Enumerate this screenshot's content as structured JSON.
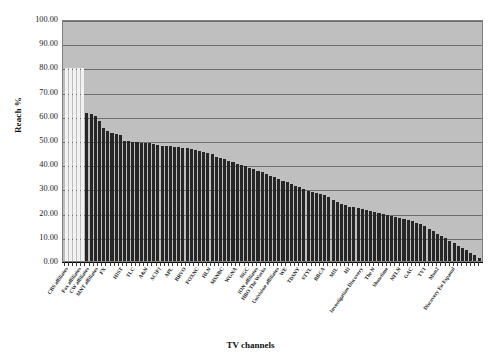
{
  "chart_data": {
    "type": "bar",
    "title": "",
    "xlabel": "TV channels",
    "ylabel": "Reach %",
    "ylim": [
      0,
      100
    ],
    "ytick_labels": [
      "100.00",
      "90.00",
      "80.00",
      "70.00",
      "60.00",
      "50.00",
      "40.00",
      "30.00",
      "20.00",
      "10.00",
      "0.00"
    ],
    "ytick_values": [
      100,
      90,
      80,
      70,
      60,
      50,
      40,
      30,
      20,
      10,
      0
    ],
    "grid": true,
    "legend": "none",
    "plot_background": "#bfbfbf",
    "bar_color": "#262626",
    "highlight_bar_color": "#f2f2f2",
    "categories": [
      "CBS affiliates",
      "ABC affiliates",
      "NBC affiliates",
      "Fox affiliates",
      "PBS affiliates",
      "CW affiliates",
      "ION affiliates b",
      "MNT affiliates",
      "ESPN",
      "FX",
      "USA",
      "TNT",
      "TBS",
      "HIST",
      "DISC",
      "LIFE",
      "TLC",
      "AMC",
      "SPIKE",
      "A&N",
      "FAM",
      "SYFY",
      "SCIFI",
      "TRAV",
      "E!",
      "APL",
      "HGTV",
      "FOOD",
      "BRVO",
      "CNN",
      "TVLAND",
      "FOXNC",
      "CMT",
      "MTV",
      "HLN",
      "VH1",
      "CNBC",
      "MSNBC",
      "OXYGEN",
      "TOON",
      "WGNA",
      "DSC",
      "NICK",
      "NGC",
      "TWC",
      "ION affiliates",
      "GSN",
      "HBO The Works",
      "SOAP",
      "HALL",
      "Univision affiliates",
      "BET",
      "WE",
      "TELE",
      "LOGO",
      "TDSNY",
      "TVG",
      "CSPAN",
      "STYL",
      "OWN",
      "PLANET",
      "BBCA",
      "SPEED",
      "CLOO",
      "MIL",
      "FUSE",
      "CHILLER",
      "HI",
      "FM",
      "PBS Kids",
      "Investigation Discovery",
      "CURRENT",
      "BIO",
      "The N",
      "SUNDANCE",
      "IFC",
      "Showtime",
      "ENCORE",
      "MAX",
      "NFLN",
      "NBCSN",
      "EPIX",
      "GAC",
      "OUTDOOR",
      "SPROUT",
      "TV1",
      "TENNIS",
      "RLTV",
      "Mun2",
      "GOLF",
      "CENTRIC",
      "BBCW",
      "Discovery En Espanol",
      "MGM",
      "HUB",
      "SUNDNC2",
      "FEARNET",
      "INSP",
      "TVONE2",
      "WAPA"
    ],
    "values": [
      80.5,
      80.5,
      80.5,
      80.5,
      80.5,
      61.5,
      61.2,
      60.6,
      58.2,
      55.3,
      54.3,
      53.2,
      52.8,
      52.3,
      50.0,
      49.8,
      49.6,
      49.5,
      49.3,
      49.2,
      49.0,
      48.6,
      48.3,
      48.1,
      47.9,
      47.8,
      47.5,
      47.3,
      47.1,
      46.9,
      46.6,
      46.3,
      46.0,
      45.6,
      45.2,
      44.4,
      43.5,
      43.0,
      42.4,
      41.8,
      41.2,
      40.6,
      40.0,
      39.4,
      38.8,
      38.2,
      37.6,
      37.0,
      36.3,
      35.6,
      34.9,
      34.2,
      33.5,
      32.8,
      32.1,
      31.4,
      30.7,
      30.0,
      29.3,
      28.8,
      28.3,
      27.8,
      27.3,
      26.5,
      25.6,
      24.6,
      23.8,
      23.2,
      22.7,
      22.3,
      21.9,
      21.5,
      21.1,
      20.7,
      20.3,
      19.9,
      19.5,
      19.1,
      18.7,
      18.3,
      17.9,
      17.5,
      17.1,
      16.6,
      16.0,
      15.3,
      14.4,
      13.4,
      12.4,
      11.4,
      10.4,
      9.4,
      8.4,
      7.4,
      6.4,
      5.4,
      4.4,
      3.4,
      2.4,
      1.4
    ],
    "highlight_indices": [
      0,
      1,
      2,
      3,
      4
    ],
    "visible_tick_labels": [
      {
        "index": 0,
        "text": "CBS affiliates"
      },
      {
        "index": 3,
        "text": "Fox affiliates"
      },
      {
        "index": 5,
        "text": "CW affiliates"
      },
      {
        "index": 7,
        "text": "MNT affiliates"
      },
      {
        "index": 9,
        "text": "FX"
      },
      {
        "index": 13,
        "text": "HIST"
      },
      {
        "index": 16,
        "text": "TLC"
      },
      {
        "index": 19,
        "text": "A&N"
      },
      {
        "index": 22,
        "text": "SCIFI"
      },
      {
        "index": 25,
        "text": "APL"
      },
      {
        "index": 28,
        "text": "BRVO"
      },
      {
        "index": 31,
        "text": "FOXNC"
      },
      {
        "index": 34,
        "text": "HLN"
      },
      {
        "index": 37,
        "text": "MSNBC"
      },
      {
        "index": 40,
        "text": "WGNA"
      },
      {
        "index": 43,
        "text": "NGC"
      },
      {
        "index": 45,
        "text": "ION affiliates"
      },
      {
        "index": 47,
        "text": "HBO The Works"
      },
      {
        "index": 50,
        "text": "Univision affiliates"
      },
      {
        "index": 52,
        "text": "WE"
      },
      {
        "index": 55,
        "text": "TDSNY"
      },
      {
        "index": 58,
        "text": "STYL"
      },
      {
        "index": 61,
        "text": "BBCA"
      },
      {
        "index": 64,
        "text": "MIL"
      },
      {
        "index": 67,
        "text": "HI"
      },
      {
        "index": 70,
        "text": "Investigation Discovery"
      },
      {
        "index": 73,
        "text": "The N"
      },
      {
        "index": 76,
        "text": "Showtime"
      },
      {
        "index": 79,
        "text": "NFLN"
      },
      {
        "index": 82,
        "text": "GAC"
      },
      {
        "index": 85,
        "text": "TV1"
      },
      {
        "index": 88,
        "text": "Mun2"
      },
      {
        "index": 92,
        "text": "Discovery En Espanol"
      }
    ]
  }
}
